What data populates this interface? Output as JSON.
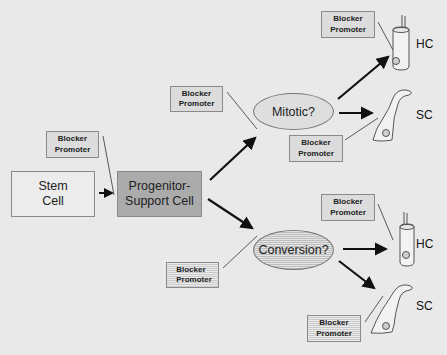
{
  "diagram": {
    "nodes": {
      "stem_cell": {
        "label": "Stem\nCell",
        "line1": "Stem",
        "line2": "Cell"
      },
      "progenitor": {
        "line1": "Progenitor-",
        "line2": "Support Cell"
      },
      "mitotic": {
        "label": "Mitotic?"
      },
      "conversion": {
        "label": "Conversion?"
      }
    },
    "modulators": [
      {
        "id": "bp-progenitor",
        "line1": "Blocker",
        "line2": "Promoter"
      },
      {
        "id": "bp-mitotic",
        "line1": "Blocker",
        "line2": "Promoter"
      },
      {
        "id": "bp-mitotic-hc",
        "line1": "Blocker",
        "line2": "Promoter"
      },
      {
        "id": "bp-mitotic-sc",
        "line1": "Blocker",
        "line2": "Promoter"
      },
      {
        "id": "bp-conversion",
        "line1": "Blocker",
        "line2": "Promoter"
      },
      {
        "id": "bp-conversion-hc",
        "line1": "Blocker",
        "line2": "Promoter"
      },
      {
        "id": "bp-conversion-sc",
        "line1": "Blocker",
        "line2": "Promoter"
      }
    ],
    "outcomes": {
      "hc_top": "HC",
      "sc_top": "SC",
      "hc_bottom": "HC",
      "sc_bottom": "SC"
    },
    "edges": [
      {
        "from": "Stem Cell",
        "to": "Progenitor-Support Cell"
      },
      {
        "from": "Progenitor-Support Cell",
        "to": "Mitotic?"
      },
      {
        "from": "Progenitor-Support Cell",
        "to": "Conversion?"
      },
      {
        "from": "Mitotic?",
        "to": "HC"
      },
      {
        "from": "Mitotic?",
        "to": "SC"
      },
      {
        "from": "Conversion?",
        "to": "HC"
      },
      {
        "from": "Conversion?",
        "to": "SC"
      }
    ]
  }
}
